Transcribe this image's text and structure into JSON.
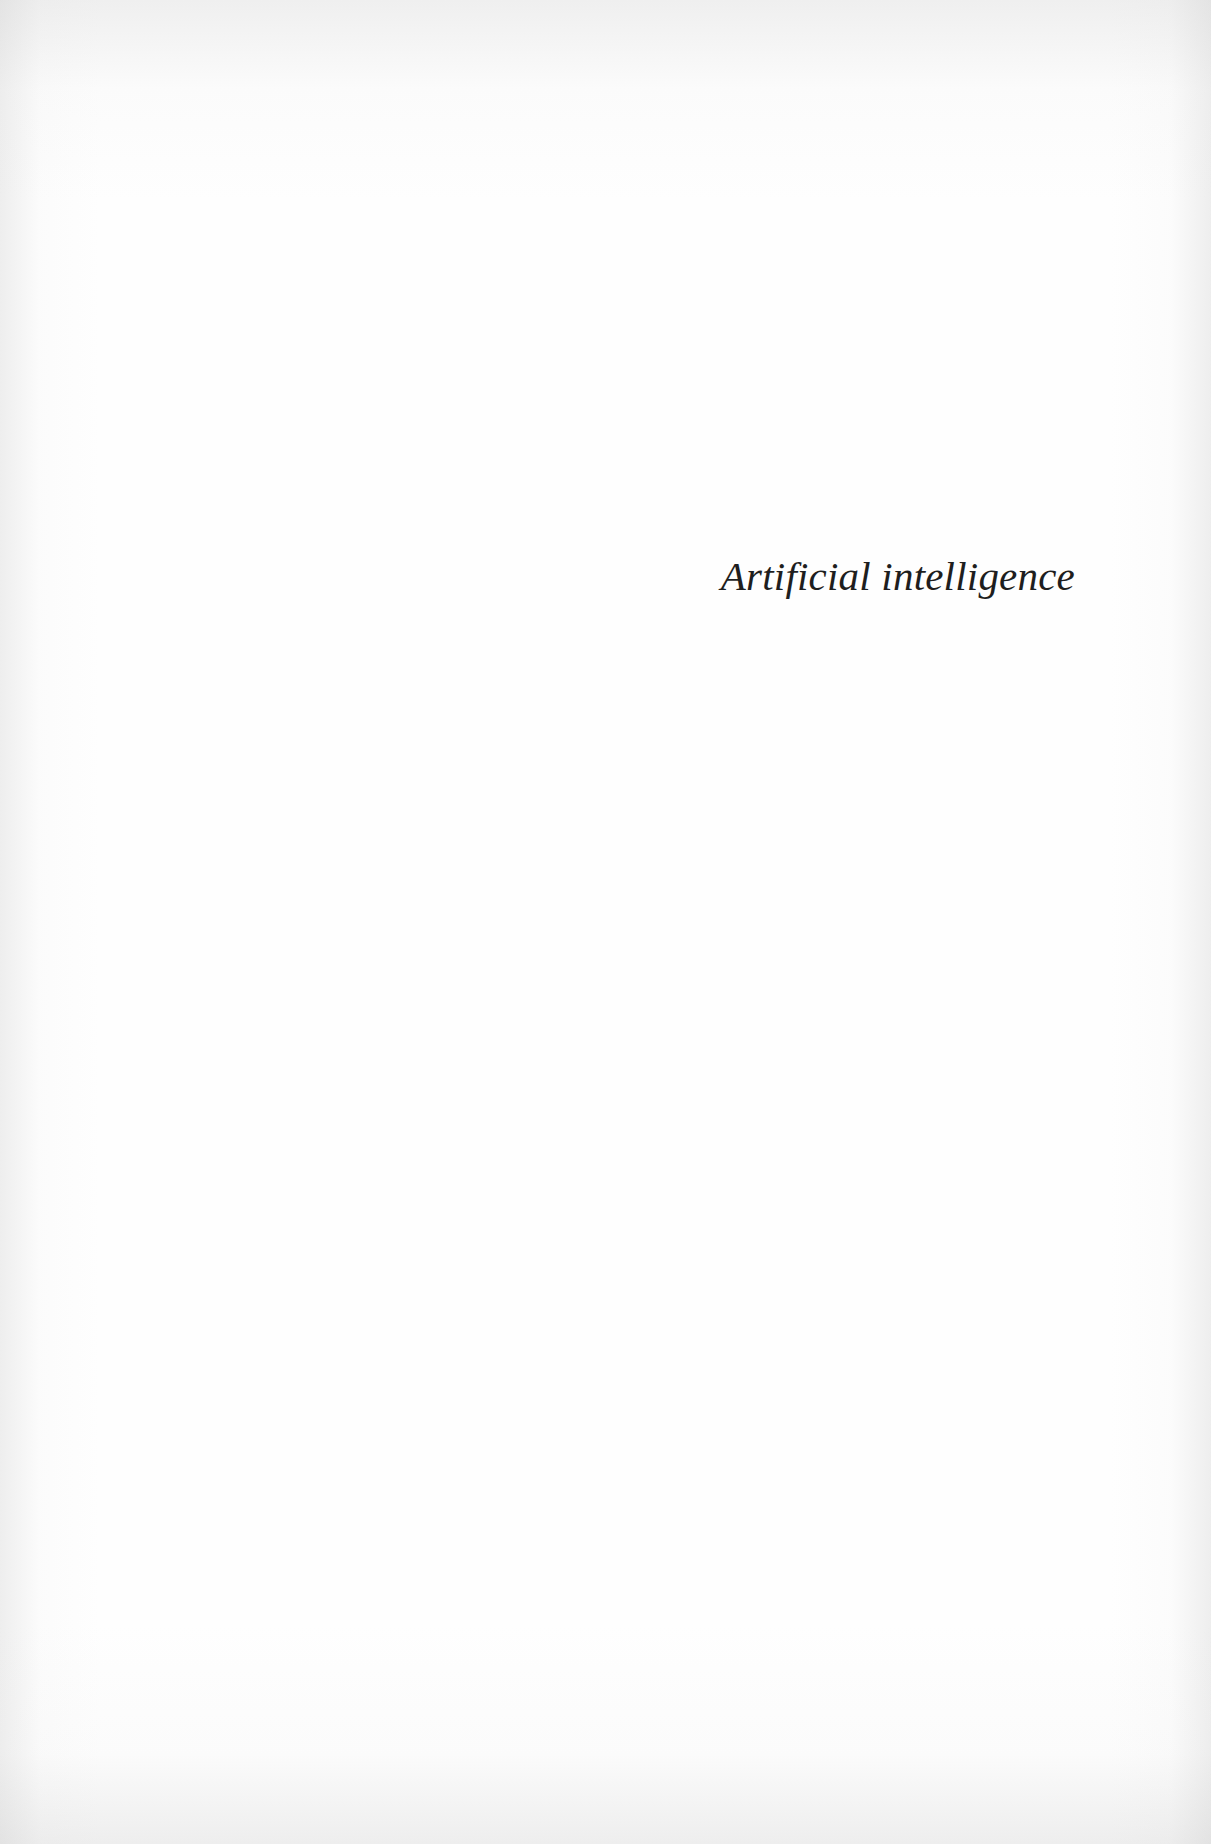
{
  "page": {
    "type": "half-title page",
    "half_title": "Artificial intelligence",
    "colors": {
      "paper": "#fefefe",
      "text": "#1e1e1e"
    }
  }
}
